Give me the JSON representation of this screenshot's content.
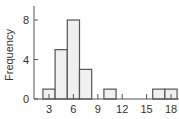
{
  "chart_data": {
    "type": "bar",
    "subtype": "histogram",
    "title": "",
    "xlabel": "",
    "ylabel": "Frequency",
    "bin_width": 1.5,
    "bins": [
      {
        "start": 2.25,
        "end": 3.75,
        "count": 1
      },
      {
        "start": 3.75,
        "end": 5.25,
        "count": 5
      },
      {
        "start": 5.25,
        "end": 6.75,
        "count": 8
      },
      {
        "start": 6.75,
        "end": 8.25,
        "count": 3
      },
      {
        "start": 8.25,
        "end": 9.75,
        "count": 0
      },
      {
        "start": 9.75,
        "end": 11.25,
        "count": 1
      },
      {
        "start": 11.25,
        "end": 12.75,
        "count": 0
      },
      {
        "start": 12.75,
        "end": 14.25,
        "count": 0
      },
      {
        "start": 14.25,
        "end": 15.75,
        "count": 0
      },
      {
        "start": 15.75,
        "end": 17.25,
        "count": 1
      },
      {
        "start": 17.25,
        "end": 18.75,
        "count": 1
      }
    ],
    "xticks": [
      3,
      6,
      9,
      12,
      15,
      18
    ],
    "yticks": [
      0,
      4,
      8
    ],
    "xlim": [
      1.5,
      19
    ],
    "ylim": [
      0,
      10
    ],
    "grid": false,
    "colors": {
      "fill": "#f0f0f0",
      "edge": "#555555",
      "axis": "#555555",
      "text": "#333333"
    }
  }
}
